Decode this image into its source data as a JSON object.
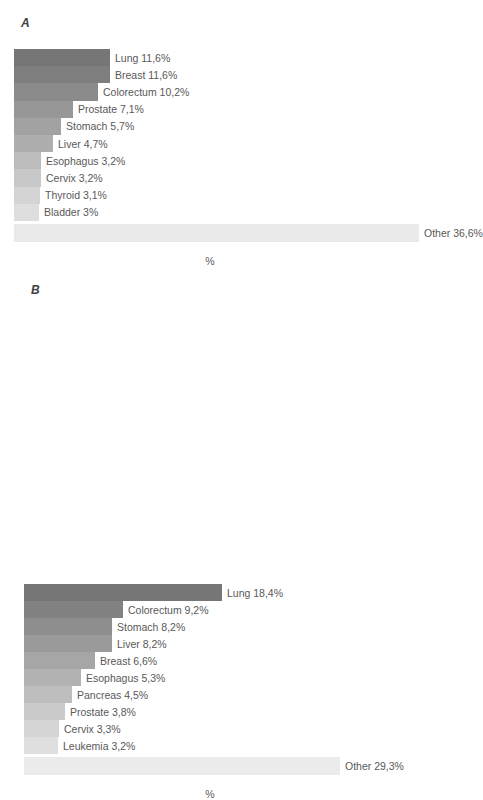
{
  "figure": {
    "axis_label": "%",
    "bar_color_dark": "#767676",
    "bar_color_light": "#e9e9e9"
  },
  "panels": [
    {
      "id": "A",
      "label": "A",
      "axis_label": "%"
    },
    {
      "id": "B",
      "label": "B",
      "axis_label": "%"
    }
  ],
  "chart_data": [
    {
      "type": "bar",
      "title": "A",
      "orientation": "horizontal",
      "xlabel": "%",
      "ylabel": "",
      "xlim": [
        0,
        36.6
      ],
      "grid": false,
      "legend": "none",
      "categories": [
        "Lung",
        "Breast",
        "Colorectum",
        "Prostate",
        "Stomach",
        "Liver",
        "Esophagus",
        "Cervix",
        "Thyroid",
        "Bladder",
        "Other"
      ],
      "values": [
        11.6,
        11.6,
        10.2,
        7.1,
        5.7,
        4.7,
        3.2,
        3.2,
        3.1,
        3.0,
        36.6
      ],
      "labels": [
        "Lung 11,6%",
        "Breast 11,6%",
        "Colorectum 10,2%",
        "Prostate 7,1%",
        "Stomach 5,7%",
        "Liver 4,7%",
        "Esophagus 3,2%",
        "Cervix 3,2%",
        "Thyroid 3,1%",
        "Bladder 3%",
        "Other 36,6%"
      ],
      "colors": [
        "#767676",
        "#7e7e7e",
        "#8b8b8b",
        "#979797",
        "#a2a2a2",
        "#aeaeae",
        "#bcbcbc",
        "#c8c8c8",
        "#d4d4d4",
        "#dedede",
        "#eaeaea"
      ],
      "bar_px_widths": [
        96,
        96,
        84,
        59,
        47,
        39,
        27,
        27,
        26,
        25,
        405
      ]
    },
    {
      "type": "bar",
      "title": "B",
      "orientation": "horizontal",
      "xlabel": "%",
      "ylabel": "",
      "xlim": [
        0,
        29.3
      ],
      "grid": false,
      "legend": "none",
      "categories": [
        "Lung",
        "Colorectum",
        "Stomach",
        "Liver",
        "Breast",
        "Esophagus",
        "Pancreas",
        "Prostate",
        "Cervix",
        "Leukemia",
        "Other"
      ],
      "values": [
        18.4,
        9.2,
        8.2,
        8.2,
        6.6,
        5.3,
        4.5,
        3.8,
        3.3,
        3.2,
        29.3
      ],
      "labels": [
        "Lung 18,4%",
        "Colorectum 9,2%",
        "Stomach 8,2%",
        "Liver 8,2%",
        "Breast 6,6%",
        "Esophagus 5,3%",
        "Pancreas 4,5%",
        "Prostate 3,8%",
        "Cervix 3,3%",
        "Leukemia 3,2%",
        "Other 29,3%"
      ],
      "colors": [
        "#767676",
        "#828282",
        "#8e8e8e",
        "#9a9a9a",
        "#a6a6a6",
        "#b2b2b2",
        "#bebebe",
        "#cacaca",
        "#d5d5d5",
        "#dfdfdf",
        "#ebebeb"
      ],
      "bar_px_widths": [
        198,
        99,
        88,
        88,
        71,
        57,
        48,
        41,
        35,
        34,
        316
      ]
    }
  ]
}
